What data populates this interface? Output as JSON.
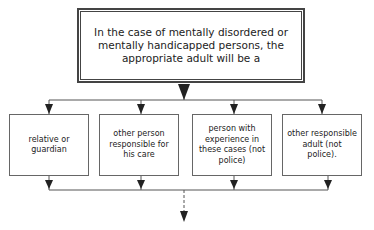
{
  "diagram": {
    "type": "flowchart",
    "top": {
      "text": "In the case of mentally disordered or mentally handicapped persons, the appropriate adult will be a"
    },
    "options": [
      {
        "id": "relative",
        "text": "relative or guardian"
      },
      {
        "id": "carer",
        "text": "other person responsible for his care"
      },
      {
        "id": "experienced",
        "text": "person with experience in these cases (not police)"
      },
      {
        "id": "other-adult",
        "text": "other responsible adult (not police)."
      }
    ],
    "colors": {
      "line": "#555555",
      "arrow": "#222222",
      "border": "#444444"
    }
  }
}
